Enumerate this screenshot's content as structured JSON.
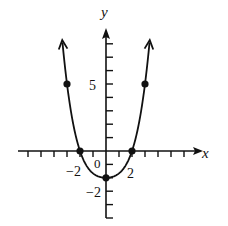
{
  "chart_data": {
    "type": "line",
    "title": "",
    "xlabel": "x",
    "ylabel": "y",
    "x_tick_labels": [
      "-2",
      "2"
    ],
    "y_tick_labels": [
      "5",
      "-2"
    ],
    "origin_label": "0",
    "xlim": [
      -7,
      7
    ],
    "ylim": [
      -4,
      9
    ],
    "grid": false,
    "series": [
      {
        "name": "curve",
        "description": "quartic-like U-shaped curve, even symmetry, arrows at both ends pointing upward",
        "points": [
          {
            "x": -3,
            "y": 5
          },
          {
            "x": -2,
            "y": 0
          },
          {
            "x": 0,
            "y": -2
          },
          {
            "x": 2,
            "y": 0
          },
          {
            "x": 3,
            "y": 5
          }
        ]
      }
    ]
  },
  "labels": {
    "x_axis": "x",
    "y_axis": "y",
    "y_five": "5",
    "y_neg_two": "−2",
    "x_neg_two": "−2",
    "x_two": "2",
    "origin": "0"
  },
  "colors": {
    "ink": "#111111",
    "background": "#ffffff"
  }
}
